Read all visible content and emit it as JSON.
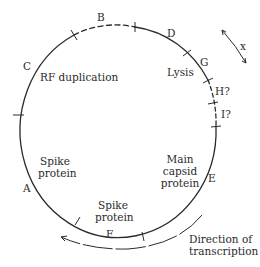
{
  "diagram": {
    "genes": [
      {
        "id": "A",
        "label": "A"
      },
      {
        "id": "B",
        "label": "B"
      },
      {
        "id": "C",
        "label": "C"
      },
      {
        "id": "D",
        "label": "D"
      },
      {
        "id": "E",
        "label": "E"
      },
      {
        "id": "F",
        "label": "F"
      },
      {
        "id": "G",
        "label": "G"
      },
      {
        "id": "H",
        "label": "H?"
      },
      {
        "id": "I",
        "label": "I?"
      }
    ],
    "functions": {
      "rf_duplication": "RF duplication",
      "lysis": "Lysis",
      "spike_protein_a_line1": "Spike",
      "spike_protein_a_line2": "protein",
      "spike_protein_f_line1": "Spike",
      "spike_protein_f_line2": "protein",
      "main_capsid_line1": "Main",
      "main_capsid_line2": "capsid",
      "main_capsid_line3": "protein"
    },
    "transcription": {
      "line1": "Direction of",
      "line2": "transcription"
    },
    "x_arrow_label": "x",
    "colors": {
      "line": "#2a2a2a",
      "background": "#ffffff"
    }
  }
}
